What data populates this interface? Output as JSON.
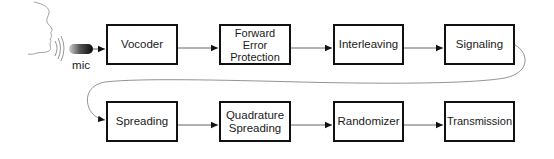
{
  "diagram": {
    "source": {
      "speaker_icon": "face-profile",
      "sound_icon": "sound-waves",
      "mic_icon": "microphone",
      "mic_label": "mic"
    },
    "row1": [
      {
        "id": "vocoder",
        "label": "Vocoder"
      },
      {
        "id": "fec",
        "label": "Forward\nError\nProtection"
      },
      {
        "id": "interleaving",
        "label": "Interleaving"
      },
      {
        "id": "signaling",
        "label": "Signaling"
      }
    ],
    "row2": [
      {
        "id": "spreading",
        "label": "Spreading"
      },
      {
        "id": "quadrature-spreading",
        "label": "Quadrature\nSpreading"
      },
      {
        "id": "randomizer",
        "label": "Randomizer"
      },
      {
        "id": "transmission",
        "label": "Transmission"
      }
    ],
    "edges": [
      {
        "from": "mic",
        "to": "vocoder"
      },
      {
        "from": "vocoder",
        "to": "fec"
      },
      {
        "from": "fec",
        "to": "interleaving"
      },
      {
        "from": "interleaving",
        "to": "signaling"
      },
      {
        "from": "signaling",
        "to": "spreading",
        "style": "curved"
      },
      {
        "from": "spreading",
        "to": "quadrature-spreading"
      },
      {
        "from": "quadrature-spreading",
        "to": "randomizer"
      },
      {
        "from": "randomizer",
        "to": "transmission"
      }
    ],
    "colors": {
      "box_border": "#111111",
      "line": "#555555",
      "text": "#1a1a1a",
      "background": "#ffffff"
    }
  }
}
